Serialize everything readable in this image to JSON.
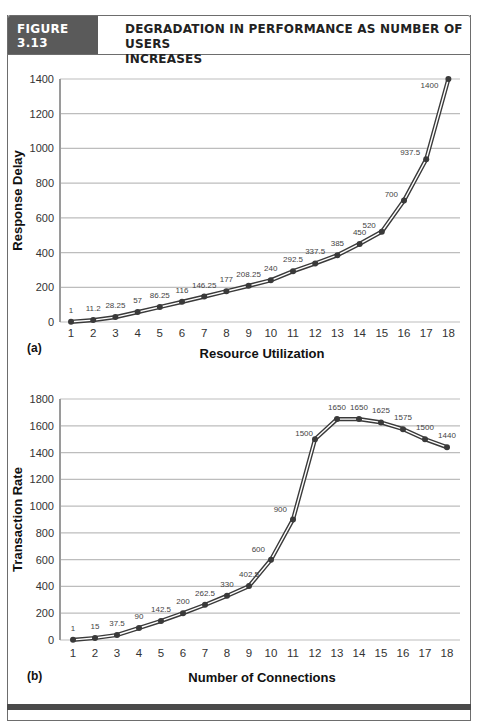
{
  "figure": {
    "label": "FIGURE 3.13",
    "title_line1": "DEGRADATION IN PERFORMANCE AS NUMBER OF USERS",
    "title_line2": "INCREASES",
    "colors": {
      "label_bg": "#5a5a5a",
      "line": "#3a3a3a",
      "grid": "#bdbdbd",
      "axis": "#9a9a9a"
    }
  },
  "chart_data": [
    {
      "type": "line",
      "panel": "(a)",
      "title": "",
      "xlabel": "Resource Utilization",
      "ylabel": "Response Delay",
      "x": [
        1,
        2,
        3,
        4,
        5,
        6,
        7,
        8,
        9,
        10,
        11,
        12,
        13,
        14,
        15,
        16,
        17,
        18
      ],
      "values": [
        1,
        11.2,
        28.25,
        57,
        86.25,
        116,
        146.25,
        177,
        208.25,
        240,
        292.5,
        337.5,
        385,
        450,
        520,
        700,
        937.5,
        1400
      ],
      "data_labels": [
        "1",
        "11.2",
        "28.25",
        "57",
        "86.25",
        "116",
        "146.25",
        "177",
        "208.25",
        "240",
        "292.5",
        "337.5",
        "385",
        "450",
        "520",
        "700",
        "937.5",
        "1400"
      ],
      "y_ticks": [
        "0",
        "200",
        "400",
        "600",
        "800",
        "1000",
        "1200",
        "1400"
      ],
      "x_ticks": [
        "1",
        "2",
        "3",
        "4",
        "5",
        "6",
        "7",
        "8",
        "9",
        "10",
        "11",
        "12",
        "13",
        "14",
        "15",
        "16",
        "17",
        "18"
      ],
      "ylim": [
        0,
        1400
      ],
      "grid": true,
      "legend": null
    },
    {
      "type": "line",
      "panel": "(b)",
      "title": "",
      "xlabel": "Number of Connections",
      "ylabel": "Transaction Rate",
      "x": [
        1,
        2,
        3,
        4,
        5,
        6,
        7,
        8,
        9,
        10,
        11,
        12,
        13,
        14,
        15,
        16,
        17,
        18
      ],
      "values": [
        1,
        15,
        37.5,
        90,
        142.5,
        200,
        262.5,
        330,
        402.5,
        600,
        900,
        1500,
        1650,
        1650,
        1625,
        1575,
        1500,
        1440
      ],
      "data_labels": [
        "1",
        "15",
        "37.5",
        "90",
        "142.5",
        "200",
        "262.5",
        "330",
        "402.5",
        "600",
        "900",
        "1500",
        "1650",
        "1650",
        "1625",
        "1575",
        "1500",
        "1440"
      ],
      "y_ticks": [
        "0",
        "200",
        "400",
        "600",
        "800",
        "1000",
        "1200",
        "1400",
        "1600",
        "1800"
      ],
      "x_ticks": [
        "1",
        "2",
        "3",
        "4",
        "5",
        "6",
        "7",
        "8",
        "9",
        "10",
        "11",
        "12",
        "13",
        "14",
        "15",
        "16",
        "17",
        "18"
      ],
      "ylim": [
        0,
        1800
      ],
      "grid": true,
      "legend": null
    }
  ]
}
